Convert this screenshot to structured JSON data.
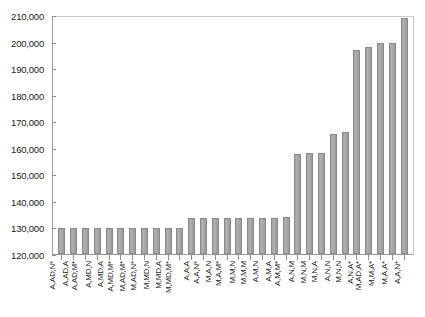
{
  "chart_data": {
    "type": "bar",
    "title": "",
    "subtitle": "",
    "xlabel": "",
    "ylabel": "",
    "ylim": [
      120000,
      210000
    ],
    "ytick_step": 10000,
    "yticks": [
      "210,000",
      "200,000",
      "190,000",
      "180,000",
      "170,000",
      "160,000",
      "150,000",
      "140,000",
      "130,000",
      "120,000"
    ],
    "ytick_values": [
      210000,
      200000,
      190000,
      180000,
      170000,
      160000,
      150000,
      140000,
      130000,
      120000
    ],
    "grid": false,
    "legend": "none",
    "bar_color": "#a6a6a6",
    "bar_border_color": "#8a8a8a",
    "axis_color": "#8f8f8f",
    "categories": [
      "A,AD,N*",
      "A,AD,A",
      "A,AD,M*",
      "A,MD,N",
      "A,MD,A",
      "A,MD,M*",
      "M,AD,M*",
      "M,AD,N*",
      "M,MD,N",
      "M,MD,A",
      "M,MD,M*",
      "A,A,A",
      "A,A,N*",
      "M,A,N",
      "M,A,M*",
      "M,M,N",
      "M,M,M",
      "A,M,N",
      "A,M,A",
      "A,M,M*",
      "A,N,M",
      "M,N,M",
      "M,N,A",
      "A,N,N",
      "M,N,N",
      "A,N,A*",
      "M,AD,A*",
      "M,M,A*",
      "M,A,A*",
      "A,A,N*"
    ],
    "values": [
      129800,
      129700,
      129700,
      129700,
      129700,
      129800,
      129900,
      129900,
      129900,
      129900,
      130000,
      133700,
      133800,
      133700,
      133800,
      133800,
      133800,
      133800,
      133800,
      134000,
      158000,
      158200,
      158300,
      165500,
      166200,
      197300,
      198800,
      200000,
      200200,
      209600
    ]
  }
}
